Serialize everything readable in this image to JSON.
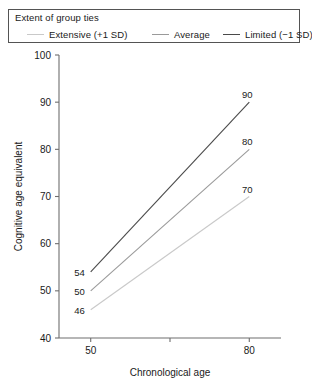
{
  "legend": {
    "title": "Extent of group ties",
    "items": [
      {
        "label": "Extensive (+1 SD)",
        "color": "#c9c9c9"
      },
      {
        "label": "Average",
        "color": "#9a9a9a"
      },
      {
        "label": "Limited (−1 SD)",
        "color": "#4a4a4a"
      }
    ]
  },
  "axes": {
    "y_title": "Cognitive age equivalent",
    "x_title": "Chronological age",
    "y_ticks": [
      "40",
      "50",
      "60",
      "70",
      "80",
      "90",
      "100"
    ],
    "x_ticks": [
      "50",
      "80"
    ]
  },
  "chart_data": {
    "type": "line",
    "title": "",
    "subtitle": "",
    "xlabel": "Chronological age",
    "ylabel": "Cognitive age equivalent",
    "xlim": [
      44,
      86
    ],
    "ylim": [
      40,
      100
    ],
    "x": [
      50,
      80
    ],
    "xtick_labels": [
      "50",
      "80"
    ],
    "ytick_labels": [
      "40",
      "50",
      "60",
      "70",
      "80",
      "90",
      "100"
    ],
    "grid": false,
    "legend_position": "top",
    "legend_title": "Extent of group ties",
    "series": [
      {
        "name": "Extensive (+1 SD)",
        "color": "#c9c9c9",
        "values": [
          46,
          70
        ],
        "start_label": "46",
        "end_label": "70"
      },
      {
        "name": "Average",
        "color": "#9a9a9a",
        "values": [
          50,
          80
        ],
        "start_label": "50",
        "end_label": "80"
      },
      {
        "name": "Limited (−1 SD)",
        "color": "#4a4a4a",
        "values": [
          54,
          90
        ],
        "start_label": "54",
        "end_label": "90"
      }
    ],
    "annotations": [
      {
        "text": "54",
        "x": 50,
        "y": 54
      },
      {
        "text": "50",
        "x": 50,
        "y": 50
      },
      {
        "text": "46",
        "x": 50,
        "y": 46
      },
      {
        "text": "90",
        "x": 80,
        "y": 90
      },
      {
        "text": "80",
        "x": 80,
        "y": 80
      },
      {
        "text": "70",
        "x": 80,
        "y": 70
      }
    ]
  }
}
